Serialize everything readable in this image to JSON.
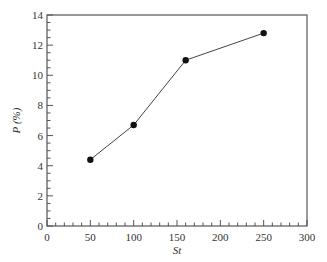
{
  "chart_data": {
    "type": "line",
    "title": "",
    "xlabel": "St",
    "ylabel": "P (%)",
    "xlim": [
      0,
      300
    ],
    "ylim": [
      0,
      14
    ],
    "x_ticks": [
      0,
      50,
      100,
      150,
      200,
      250,
      300
    ],
    "y_ticks": [
      0,
      2,
      4,
      6,
      8,
      10,
      12,
      14
    ],
    "x_minor_step": 10,
    "y_minor_step": 0.5,
    "grid": false,
    "legend": null,
    "series": [
      {
        "name": "P",
        "marker": "filled-circle",
        "color": "#111111",
        "x": [
          50,
          100,
          160,
          250
        ],
        "y": [
          4.4,
          6.7,
          11.0,
          12.8
        ]
      }
    ]
  },
  "labels": {
    "xlabel": "St",
    "ylabel": "P (%)",
    "x_ticks": [
      "0",
      "50",
      "100",
      "150",
      "200",
      "250",
      "300"
    ],
    "y_ticks": [
      "0",
      "2",
      "4",
      "6",
      "8",
      "10",
      "12",
      "14"
    ]
  }
}
